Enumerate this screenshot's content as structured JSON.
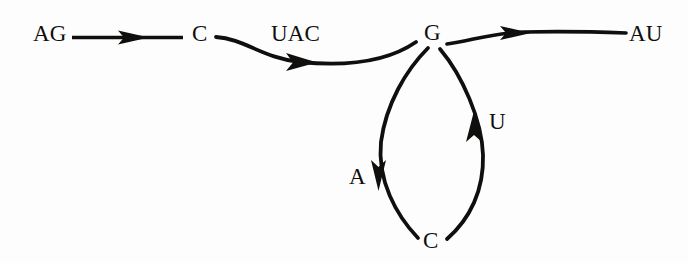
{
  "diagram": {
    "background_color": "#fdfdfd",
    "ink_color": "#100f0e",
    "nodes": [
      {
        "id": "ag",
        "label": "AG",
        "x": 33,
        "y": 42
      },
      {
        "id": "c1",
        "label": "C",
        "x": 192,
        "y": 42
      },
      {
        "id": "g",
        "label": "G",
        "x": 424,
        "y": 41
      },
      {
        "id": "au",
        "label": "AU",
        "x": 629,
        "y": 42
      },
      {
        "id": "c2",
        "label": "C",
        "x": 423,
        "y": 249
      }
    ],
    "edges": [
      {
        "id": "ag-to-c1",
        "from": "ag",
        "to": "c1",
        "label": "",
        "shape": "straight",
        "direction": "right"
      },
      {
        "id": "c1-to-g",
        "from": "c1",
        "to": "g",
        "label": "UAC",
        "shape": "s-curve",
        "direction": "right"
      },
      {
        "id": "g-to-au",
        "from": "g",
        "to": "au",
        "label": "",
        "shape": "s-curve",
        "direction": "right"
      },
      {
        "id": "g-to-c2",
        "from": "g",
        "to": "c2",
        "label": "A",
        "shape": "arc-left",
        "direction": "down"
      },
      {
        "id": "c2-to-g",
        "from": "c2",
        "to": "g",
        "label": "U",
        "shape": "arc-right",
        "direction": "up"
      }
    ],
    "edge_labels": [
      {
        "id": "uac",
        "text": "UAC",
        "x": 271,
        "y": 42
      },
      {
        "id": "a",
        "text": "A",
        "x": 349,
        "y": 185
      },
      {
        "id": "u",
        "text": "U",
        "x": 489,
        "y": 130
      }
    ]
  }
}
